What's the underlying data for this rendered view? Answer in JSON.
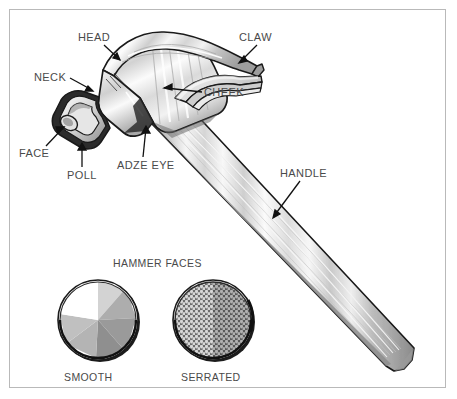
{
  "figure": {
    "background_color": "#ffffff",
    "border_color": "#b9b9b9",
    "label_color": "#4a4a4a",
    "line_color": "#1a1a1a"
  },
  "callouts": [
    {
      "id": "head",
      "label": "HEAD",
      "x": 78,
      "y": 32
    },
    {
      "id": "claw",
      "label": "CLAW",
      "x": 239,
      "y": 32
    },
    {
      "id": "neck",
      "label": "NECK",
      "x": 34,
      "y": 72
    },
    {
      "id": "cheek",
      "label": "CHEEK",
      "x": 204,
      "y": 87
    },
    {
      "id": "face",
      "label": "FACE",
      "x": 19,
      "y": 148
    },
    {
      "id": "adze-eye",
      "label": "ADZE EYE",
      "x": 117,
      "y": 160
    },
    {
      "id": "poll",
      "label": "POLL",
      "x": 67,
      "y": 170
    },
    {
      "id": "handle",
      "label": "HANDLE",
      "x": 280,
      "y": 168
    }
  ],
  "faces_section": {
    "title": "HAMMER FACES",
    "title_x": 113,
    "title_y": 258,
    "items": [
      {
        "id": "smooth",
        "label": "SMOOTH",
        "label_x": 64,
        "label_y": 372,
        "center_x": 98,
        "center_y": 320,
        "radius": 42,
        "surface": "smooth",
        "wedge_colors": [
          "#ffffff",
          "#d3d3d3",
          "#adadad",
          "#9a9a9a",
          "#c0c0c0",
          "#b4b4b4",
          "#8f8f8f"
        ]
      },
      {
        "id": "serrated",
        "label": "SERRATED",
        "label_x": 181,
        "label_y": 372,
        "center_x": 213,
        "center_y": 320,
        "radius": 42,
        "surface": "serrated",
        "mesh_color": "#6e6e6e",
        "mesh_highlight": "#d8d8d8"
      }
    ]
  },
  "hammer": {
    "parts": [
      {
        "id": "head",
        "name": "HEAD",
        "fill": "#e8e8e8"
      },
      {
        "id": "claw",
        "name": "CLAW",
        "fill": "#ededed"
      },
      {
        "id": "neck",
        "name": "NECK",
        "fill": "#dcdcdc"
      },
      {
        "id": "face",
        "name": "FACE",
        "fill": "#f2f2f2"
      },
      {
        "id": "poll",
        "name": "POLL",
        "fill": "#c9c9c9"
      },
      {
        "id": "cheek",
        "name": "CHEEK",
        "fill": "#e3e3e3"
      },
      {
        "id": "handle",
        "name": "HANDLE",
        "fill": "#e6e6e6"
      }
    ]
  }
}
